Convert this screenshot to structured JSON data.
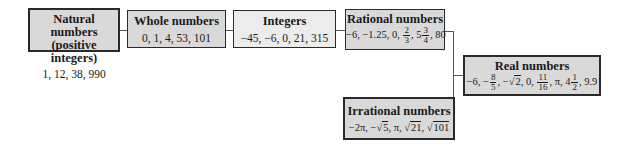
{
  "boxes": {
    "natural": {
      "title_line1": "Natural numbers",
      "title_line2": "(positive integers)",
      "values": "1, 12, 38, 990"
    },
    "whole": {
      "title": "Whole numbers",
      "values": "0, 1, 4, 53, 101"
    },
    "integers": {
      "title": "Integers",
      "values": "−45, −6, 0, 21, 315"
    },
    "rational": {
      "title": "Rational numbers",
      "values_prefix": "−6, −1.25, 0, ",
      "frac1_num": "2",
      "frac1_den": "3",
      "mid": ", 5",
      "frac2_num": "3",
      "frac2_den": "4",
      "values_suffix": ", 80"
    },
    "irrational": {
      "title": "Irrational numbers",
      "v1": "−2π, −√",
      "v1_rad": "5",
      "v2": ", π, √",
      "v2_rad": "21",
      "v3": ", √",
      "v3_rad": "101"
    },
    "real": {
      "title": "Real numbers",
      "v1": "−6, −",
      "frac1_num": "8",
      "frac1_den": "5",
      "v2": ", −√",
      "v2_rad": "2",
      "v3": ", 0, ",
      "frac2_num": "11",
      "frac2_den": "16",
      "v4": ", π, 4",
      "frac3_num": "1",
      "frac3_den": "2",
      "v5": ", 9.9"
    }
  }
}
